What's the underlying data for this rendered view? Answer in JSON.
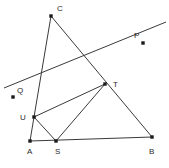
{
  "figure": {
    "type": "geometry-diagram",
    "width": 169,
    "height": 168,
    "background_color": "#ffffff",
    "line_color": "#3a3a3a",
    "point_color": "#1a1a1a",
    "label_color": "#2b2b2b"
  },
  "points": [
    {
      "id": "C",
      "label": "C",
      "x": 51,
      "y": 16,
      "label_x": 57,
      "label_y": 5
    },
    {
      "id": "P",
      "label": "P",
      "x": 143,
      "y": 43,
      "label_x": 134,
      "label_y": 32
    },
    {
      "id": "T",
      "label": "T",
      "x": 105,
      "y": 84,
      "label_x": 113,
      "label_y": 81
    },
    {
      "id": "Q",
      "label": "Q",
      "x": 13,
      "y": 97,
      "label_x": 17,
      "label_y": 87
    },
    {
      "id": "U",
      "label": "U",
      "x": 34,
      "y": 117,
      "label_x": 20,
      "label_y": 114
    },
    {
      "id": "A",
      "label": "A",
      "x": 30,
      "y": 141,
      "label_x": 27,
      "label_y": 148
    },
    {
      "id": "S",
      "label": "S",
      "x": 56,
      "y": 141,
      "label_x": 55,
      "label_y": 148
    },
    {
      "id": "B",
      "label": "B",
      "x": 152,
      "y": 137,
      "label_x": 149,
      "label_y": 148
    }
  ],
  "segments": [
    {
      "id": "AB",
      "name": "segment-a-b",
      "x1": 30,
      "y1": 141,
      "x2": 152,
      "y2": 137
    },
    {
      "id": "CU",
      "name": "segment-c-u",
      "x1": 51,
      "y1": 16,
      "x2": 34,
      "y2": 117
    },
    {
      "id": "CB",
      "name": "segment-c-t-b",
      "x1": 51,
      "y1": 16,
      "x2": 152,
      "y2": 137
    },
    {
      "id": "UT",
      "name": "segment-u-t",
      "x1": 34,
      "y1": 117,
      "x2": 105,
      "y2": 84
    },
    {
      "id": "US",
      "name": "segment-u-s",
      "x1": 34,
      "y1": 117,
      "x2": 56,
      "y2": 141
    },
    {
      "id": "ST",
      "name": "segment-s-t",
      "x1": 56,
      "y1": 141,
      "x2": 105,
      "y2": 84
    },
    {
      "id": "UA",
      "name": "segment-u-a",
      "x1": 34,
      "y1": 117,
      "x2": 30,
      "y2": 141
    },
    {
      "id": "QP",
      "name": "line-q-u-t-p",
      "x1": 4,
      "y1": 88,
      "x2": 166,
      "y2": 22
    }
  ]
}
